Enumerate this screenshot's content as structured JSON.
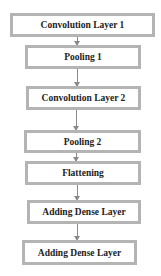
{
  "diagram": {
    "type": "flowchart",
    "direction": "top-to-bottom",
    "nodes": [
      {
        "id": "conv1",
        "label": "Convolution Layer 1"
      },
      {
        "id": "pool1",
        "label": "Pooling 1"
      },
      {
        "id": "conv2",
        "label": "Convolution Layer 2"
      },
      {
        "id": "pool2",
        "label": "Pooling 2"
      },
      {
        "id": "flatten",
        "label": "Flattening"
      },
      {
        "id": "dense1",
        "label": "Adding Dense Layer"
      },
      {
        "id": "dense2",
        "label": "Adding Dense Layer"
      }
    ],
    "edges": [
      [
        "conv1",
        "pool1"
      ],
      [
        "pool1",
        "conv2"
      ],
      [
        "conv2",
        "pool2"
      ],
      [
        "pool2",
        "flatten"
      ],
      [
        "flatten",
        "dense1"
      ],
      [
        "dense1",
        "dense2"
      ]
    ],
    "colors": {
      "border": "#b4b4b4",
      "arrow": "#8a8a8a",
      "text": "#222222"
    }
  }
}
